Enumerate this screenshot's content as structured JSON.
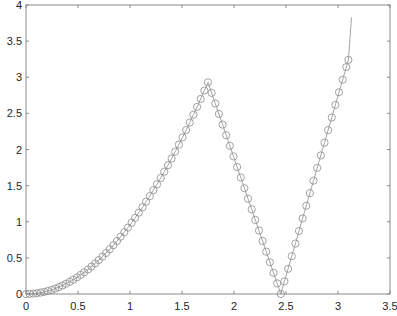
{
  "chart_data": {
    "type": "line",
    "title": "",
    "xlabel": "",
    "ylabel": "",
    "xlim": [
      0,
      3.5
    ],
    "ylim": [
      0,
      4
    ],
    "grid": false,
    "legend": null,
    "x_ticks": [
      "0",
      "0.5",
      "1",
      "1.5",
      "2",
      "2.5",
      "3",
      "3.5"
    ],
    "y_ticks": [
      "0",
      "0.5",
      "1",
      "1.5",
      "2",
      "2.5",
      "3",
      "3.5",
      "4"
    ],
    "series": [
      {
        "name": "markers",
        "style": "open-circle markers with thin connecting line",
        "color": "#8c8c8c",
        "description": "Quadratic rise y≈0.957x² from (0,0) to peak (1.75,2.93), linear fall to (2.45,0), linear rise to (3.1,3.24)",
        "x": [
          0,
          0.035,
          0.07,
          0.105,
          0.14,
          0.175,
          0.21,
          0.245,
          0.28,
          0.315,
          0.35,
          0.385,
          0.42,
          0.455,
          0.49,
          0.525,
          0.56,
          0.595,
          0.63,
          0.665,
          0.7,
          0.735,
          0.77,
          0.805,
          0.84,
          0.875,
          0.91,
          0.945,
          0.98,
          1.015,
          1.05,
          1.085,
          1.12,
          1.155,
          1.19,
          1.225,
          1.26,
          1.295,
          1.33,
          1.365,
          1.4,
          1.435,
          1.47,
          1.505,
          1.54,
          1.575,
          1.61,
          1.645,
          1.68,
          1.715,
          1.75,
          1.785,
          1.82,
          1.855,
          1.89,
          1.925,
          1.96,
          1.995,
          2.03,
          2.065,
          2.1,
          2.135,
          2.17,
          2.205,
          2.24,
          2.275,
          2.31,
          2.345,
          2.38,
          2.415,
          2.45,
          2.485,
          2.52,
          2.555,
          2.59,
          2.625,
          2.66,
          2.695,
          2.73,
          2.765,
          2.8,
          2.835,
          2.87,
          2.905,
          2.94,
          2.975,
          3.01,
          3.045,
          3.08,
          3.1
        ],
        "y": [
          0,
          0.001,
          0.005,
          0.011,
          0.019,
          0.029,
          0.042,
          0.057,
          0.075,
          0.095,
          0.117,
          0.142,
          0.169,
          0.198,
          0.23,
          0.264,
          0.3,
          0.339,
          0.38,
          0.423,
          0.469,
          0.517,
          0.567,
          0.62,
          0.675,
          0.733,
          0.793,
          0.855,
          0.919,
          0.986,
          1.055,
          1.127,
          1.2,
          1.277,
          1.355,
          1.436,
          1.519,
          1.605,
          1.693,
          1.783,
          1.876,
          1.971,
          2.068,
          2.168,
          2.27,
          2.374,
          2.481,
          2.59,
          2.701,
          2.815,
          2.93,
          2.784,
          2.637,
          2.491,
          2.344,
          2.198,
          2.051,
          1.905,
          1.758,
          1.612,
          1.465,
          1.319,
          1.172,
          1.026,
          0.879,
          0.733,
          0.586,
          0.44,
          0.293,
          0.147,
          0,
          0.174,
          0.349,
          0.523,
          0.698,
          0.872,
          1.047,
          1.221,
          1.396,
          1.57,
          1.745,
          1.919,
          2.094,
          2.268,
          2.443,
          2.617,
          2.792,
          2.966,
          3.141,
          3.24
        ]
      },
      {
        "name": "line-extension",
        "style": "thin line without markers",
        "color": "#8c8c8c",
        "x": [
          3.1,
          3.13
        ],
        "y": [
          3.24,
          3.83
        ]
      }
    ]
  },
  "axes": {
    "box_color": "#808080",
    "tick_color": "#262626"
  }
}
